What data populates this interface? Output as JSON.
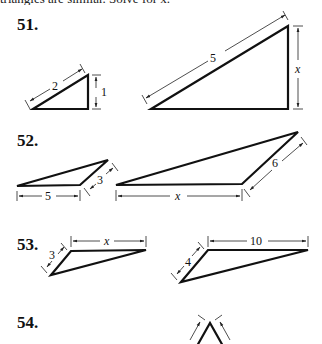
{
  "header": {
    "cut_text": "triangles are similar. Solve for x."
  },
  "problems": [
    {
      "number": "51.",
      "labels": {
        "small_hyp": "2",
        "small_leg": "1",
        "large_hyp": "5",
        "large_leg": "x"
      }
    },
    {
      "number": "52.",
      "labels": {
        "small_base": "5",
        "small_side": "3",
        "large_base": "x",
        "large_side": "6"
      }
    },
    {
      "number": "53.",
      "labels": {
        "small_side": "3",
        "small_top": "x",
        "large_side": "4",
        "large_top": "10"
      }
    },
    {
      "number": "54.",
      "labels": {}
    }
  ]
}
